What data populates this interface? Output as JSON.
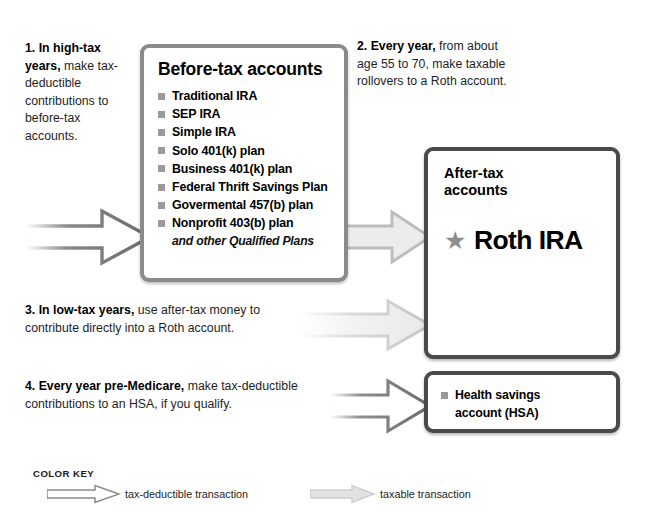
{
  "top_fragment": "                                                      ",
  "steps": [
    {
      "id": "step1",
      "bold": "1. In high-tax years,",
      "rest": " make tax-deductible contributions to before-tax accounts."
    },
    {
      "id": "step2",
      "bold": "2. Every year,",
      "rest": " from about age 55 to 70, make taxable rollovers to a Roth account."
    },
    {
      "id": "step3",
      "bold": "3. In low-tax years,",
      "rest": " use after-tax money to contribute directly into a Roth account."
    },
    {
      "id": "step4",
      "bold": "4. Every year pre-Medicare,",
      "rest": " make tax-deductible contributions to an HSA, if you qualify."
    }
  ],
  "before_tax": {
    "title": "Before-tax accounts",
    "items": [
      "Traditional IRA",
      "SEP IRA",
      "Simple IRA",
      "Solo 401(k) plan",
      "Business 401(k) plan",
      "Federal Thrift Savings Plan",
      "Govermental 457(b) plan",
      "Nonprofit 403(b) plan"
    ],
    "footnote": "and other Qualified Plans"
  },
  "after_tax": {
    "title": "After-tax accounts",
    "star_icon": "star-icon",
    "item": "Roth IRA"
  },
  "hsa": {
    "bullet_icon": "square-bullet-icon",
    "label": "Health savings account (HSA)"
  },
  "color_key": {
    "title": "COLOR KEY",
    "items": [
      {
        "icon": "arrow-outline-icon",
        "label": "tax-deductible transaction",
        "style": "deductible"
      },
      {
        "icon": "arrow-filled-icon",
        "label": "taxable transaction",
        "style": "taxable"
      }
    ]
  },
  "arrows": [
    {
      "name": "arrow-contributions-to-before-tax",
      "kind": "tax-deductible"
    },
    {
      "name": "arrow-rollover-to-roth",
      "kind": "taxable"
    },
    {
      "name": "arrow-direct-roth-contribution",
      "kind": "taxable"
    },
    {
      "name": "arrow-hsa-contribution",
      "kind": "tax-deductible"
    }
  ],
  "colors": {
    "arrow_dark_stroke": "#6a6a6a",
    "arrow_light_fill": "#d9d9d9",
    "arrow_light_stroke": "#c2c2c2",
    "box_border_light": "#8b8b8b",
    "box_border_dark": "#4a4a4a",
    "bullet_gray": "#9a9a9a",
    "star_gray": "#8d8d8d",
    "text": "#1a1a1a",
    "background": "#ffffff"
  }
}
